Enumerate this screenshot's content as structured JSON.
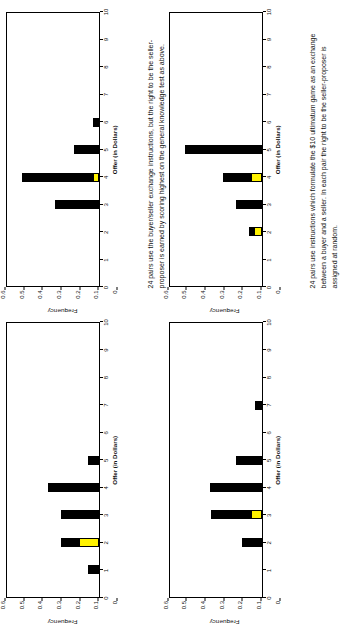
{
  "page": {
    "orientation": "rotated-90-ccw",
    "background": "#ffffff"
  },
  "style": {
    "bar_color": "#000000",
    "highlight_color": "#FFF200",
    "axis_color": "#000000"
  },
  "axes": {
    "ylabel": "Frequency",
    "xlabel": "Offer (in Dollars)",
    "yticks": [
      "0",
      "0.1",
      "0.2",
      "0.3",
      "0.4",
      "0.5",
      "0.6"
    ],
    "xticks": [
      "0",
      "1",
      "2",
      "3",
      "4",
      "5",
      "6",
      "7",
      "8",
      "9",
      "10"
    ],
    "ylim": [
      0,
      0.6
    ],
    "xlim": [
      0,
      10
    ]
  },
  "captions": {
    "a": "24 pairs use the buyer/seller exchange instructions, but the right to be the seller-proposer is earned by scoring highest on the general knowledge test as above.",
    "b": "24 pairs use instructions which formulate the $10 ultimatum game as an exchange between a buyer and a seller.  In each pair the right to be the seller-proposer is assigned at random."
  },
  "chart_data": [
    {
      "id": "chart-top-left",
      "type": "bar",
      "orientation": "vertical",
      "title": "",
      "xlabel": "Offer (in Dollars)",
      "ylabel": "Frequency",
      "xlim": [
        0,
        10
      ],
      "ylim": [
        0,
        0.6
      ],
      "grid": false,
      "categories": [
        0,
        1,
        2,
        3,
        4,
        5,
        6,
        7,
        8,
        9,
        10
      ],
      "series": [
        {
          "name": "highlight",
          "color": "#FFF200",
          "values": [
            0,
            0,
            0.125,
            0,
            0,
            0,
            0,
            0,
            0,
            0,
            0
          ]
        },
        {
          "name": "remainder",
          "color": "#000000",
          "values": [
            0,
            0.07,
            0.125,
            0.25,
            0.335,
            0.07,
            0,
            0,
            0,
            0,
            0
          ]
        }
      ],
      "totals": [
        0,
        0.07,
        0.25,
        0.25,
        0.335,
        0.07,
        0,
        0,
        0,
        0,
        0
      ]
    },
    {
      "id": "chart-top-right",
      "type": "bar",
      "orientation": "vertical",
      "title": "",
      "xlabel": "Offer (in Dollars)",
      "ylabel": "Frequency",
      "xlim": [
        0,
        10
      ],
      "ylim": [
        0,
        0.6
      ],
      "grid": false,
      "categories": [
        0,
        1,
        2,
        3,
        4,
        5,
        6,
        7,
        8,
        9,
        10
      ],
      "series": [
        {
          "name": "highlight",
          "color": "#FFF200",
          "values": [
            0,
            0,
            0,
            0,
            0.03,
            0,
            0,
            0,
            0,
            0,
            0
          ]
        },
        {
          "name": "remainder",
          "color": "#000000",
          "values": [
            0,
            0,
            0,
            0.29,
            0.47,
            0.165,
            0.04,
            0,
            0,
            0,
            0
          ]
        }
      ],
      "totals": [
        0,
        0,
        0,
        0.29,
        0.5,
        0.165,
        0.04,
        0,
        0,
        0,
        0
      ]
    },
    {
      "id": "chart-bottom-left",
      "type": "bar",
      "orientation": "vertical",
      "title": "",
      "xlabel": "Offer (in Dollars)",
      "ylabel": "Frequency",
      "xlim": [
        0,
        10
      ],
      "ylim": [
        0,
        0.6
      ],
      "grid": false,
      "categories": [
        0,
        1,
        2,
        3,
        4,
        5,
        6,
        7,
        8,
        9,
        10
      ],
      "series": [
        {
          "name": "highlight",
          "color": "#FFF200",
          "values": [
            0,
            0,
            0,
            0.06,
            0,
            0,
            0,
            0,
            0,
            0,
            0
          ]
        },
        {
          "name": "remainder",
          "color": "#000000",
          "values": [
            0,
            0,
            0.125,
            0.27,
            0.335,
            0.165,
            0,
            0.04,
            0,
            0,
            0
          ]
        }
      ],
      "totals": [
        0,
        0,
        0.125,
        0.33,
        0.335,
        0.165,
        0,
        0.04,
        0,
        0,
        0
      ]
    },
    {
      "id": "chart-bottom-right",
      "type": "bar",
      "orientation": "vertical",
      "title": "",
      "xlabel": "Offer (in Dollars)",
      "ylabel": "Frequency",
      "xlim": [
        0,
        10
      ],
      "ylim": [
        0,
        0.6
      ],
      "grid": false,
      "categories": [
        0,
        1,
        2,
        3,
        4,
        5,
        6,
        7,
        8,
        9,
        10
      ],
      "series": [
        {
          "name": "highlight",
          "color": "#FFF200",
          "values": [
            0,
            0,
            0.04,
            0,
            0.06,
            0,
            0,
            0,
            0,
            0,
            0
          ]
        },
        {
          "name": "remainder",
          "color": "#000000",
          "values": [
            0,
            0,
            0.04,
            0.165,
            0.19,
            0.5,
            0,
            0,
            0,
            0,
            0
          ]
        }
      ],
      "totals": [
        0,
        0,
        0.08,
        0.165,
        0.25,
        0.5,
        0,
        0,
        0,
        0,
        0
      ]
    }
  ]
}
